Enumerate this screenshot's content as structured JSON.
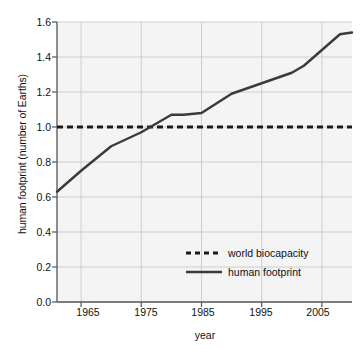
{
  "chart_data": {
    "type": "line",
    "title": "",
    "xlabel": "year",
    "ylabel": "human footprint (number of Earths)",
    "xlim": [
      1961,
      2010
    ],
    "ylim": [
      0.0,
      1.6
    ],
    "grid": true,
    "legend_position": "inside-lower-right",
    "xticks": [
      "1965",
      "1975",
      "1985",
      "1995",
      "2005"
    ],
    "xtick_values": [
      1965,
      1975,
      1985,
      1995,
      2005
    ],
    "yticks": [
      "0.0",
      "0.2",
      "0.4",
      "0.6",
      "0.8",
      "1.0",
      "1.2",
      "1.4",
      "1.6"
    ],
    "ytick_values": [
      0.0,
      0.2,
      0.4,
      0.6,
      0.8,
      1.0,
      1.2,
      1.4,
      1.6
    ],
    "series": [
      {
        "name": "world biocapacity",
        "style": "dashed",
        "color": "#1a1a1a",
        "x": [
          1961,
          2010
        ],
        "values": [
          1.0,
          1.0
        ]
      },
      {
        "name": "human footprint",
        "style": "solid",
        "color": "#3a3a3a",
        "x": [
          1961,
          1965,
          1970,
          1975,
          1980,
          1982,
          1985,
          1990,
          1995,
          2000,
          2002,
          2005,
          2008,
          2010
        ],
        "values": [
          0.63,
          0.75,
          0.89,
          0.97,
          1.07,
          1.07,
          1.08,
          1.19,
          1.25,
          1.31,
          1.35,
          1.44,
          1.53,
          1.54
        ]
      }
    ]
  },
  "legend": {
    "items": [
      {
        "label": "world biocapacity",
        "style": "dashed"
      },
      {
        "label": "human footprint",
        "style": "solid"
      }
    ]
  },
  "colors": {
    "plot_background": "#f4f4f4",
    "grid": "#c9c9c9",
    "axis": "#555555",
    "text": "#111111",
    "biocapacity_line": "#1a1a1a",
    "footprint_line": "#3a3a3a"
  }
}
